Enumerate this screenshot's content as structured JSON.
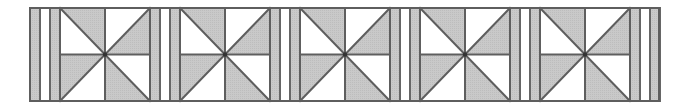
{
  "pattern": {
    "description": "Quilt border strip: repeating pinwheel blocks separated by sashing stripes",
    "canvas": {
      "width": 675,
      "height": 112
    },
    "strip": {
      "x": 30,
      "y": 8,
      "width": 629,
      "height": 93
    },
    "colors": {
      "background": "#ffffff",
      "shade": "#c9c9c9",
      "light": "#ffffff",
      "line": "#5e5e5e",
      "stripe_line": "#666666"
    },
    "line_width": 2,
    "block": {
      "count": 5,
      "width": 90,
      "height": 93,
      "first_x": 60,
      "pitch": 120,
      "center_dot_radius": 2.2,
      "triangles": [
        {
          "id": "tl-top",
          "quadrant": "top-left",
          "edge": "top",
          "shaded": true
        },
        {
          "id": "tl-left",
          "quadrant": "top-left",
          "edge": "left",
          "shaded": false
        },
        {
          "id": "tr-top",
          "quadrant": "top-right",
          "edge": "top",
          "shaded": false
        },
        {
          "id": "tr-right",
          "quadrant": "top-right",
          "edge": "right",
          "shaded": true
        },
        {
          "id": "bl-left",
          "quadrant": "bottom-left",
          "edge": "left",
          "shaded": true
        },
        {
          "id": "bl-bottom",
          "quadrant": "bottom-left",
          "edge": "bottom",
          "shaded": false
        },
        {
          "id": "br-bottom",
          "quadrant": "bottom-right",
          "edge": "bottom",
          "shaded": true
        },
        {
          "id": "br-right",
          "quadrant": "bottom-right",
          "edge": "right",
          "shaded": false
        }
      ]
    },
    "sashing": {
      "stripe_width": 10,
      "sequence": [
        "shade",
        "light",
        "shade"
      ],
      "groups_x": [
        30,
        150,
        270,
        390,
        510,
        630
      ]
    }
  }
}
